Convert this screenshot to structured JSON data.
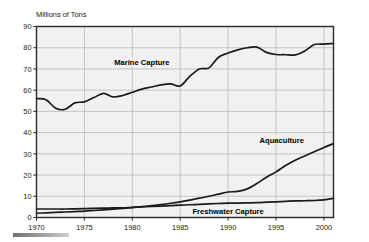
{
  "chart_data": {
    "type": "line",
    "title": "",
    "xlabel": "",
    "ylabel": "Millions of Tons",
    "xlim": [
      1970,
      2001
    ],
    "ylim": [
      0,
      90
    ],
    "grid": true,
    "legend_position": "inline-annotations",
    "xticks": [
      "1970",
      "1975",
      "1980",
      "1985",
      "1990",
      "1995",
      "2000"
    ],
    "xtick_values": [
      1970,
      1975,
      1980,
      1985,
      1990,
      1995,
      2000
    ],
    "yticks": [
      "0",
      "10",
      "20",
      "30",
      "40",
      "50",
      "60",
      "70",
      "80",
      "90"
    ],
    "ytick_values": [
      0,
      10,
      20,
      30,
      40,
      50,
      60,
      70,
      80,
      90
    ],
    "x": [
      1970,
      1971,
      1972,
      1973,
      1974,
      1975,
      1976,
      1977,
      1978,
      1979,
      1980,
      1981,
      1982,
      1983,
      1984,
      1985,
      1986,
      1987,
      1988,
      1989,
      1990,
      1991,
      1992,
      1993,
      1994,
      1995,
      1996,
      1997,
      1998,
      1999,
      2000,
      2001
    ],
    "series": [
      {
        "name": "Marine Capture",
        "label": "Marine Capture",
        "color": "#1a1a1a",
        "values": [
          56.0,
          55.5,
          51.5,
          51.0,
          54.0,
          54.5,
          56.5,
          58.5,
          56.8,
          57.5,
          59.0,
          60.5,
          61.5,
          62.5,
          63.0,
          62.0,
          66.5,
          70.0,
          70.5,
          75.5,
          77.5,
          79.0,
          80.0,
          80.3,
          77.8,
          76.8,
          76.7,
          76.6,
          78.5,
          81.5,
          81.7,
          82.0
        ]
      },
      {
        "name": "Aquaculture",
        "label": "Aquaculture",
        "color": "#1a1a1a",
        "values": [
          2.0,
          2.2,
          2.4,
          2.6,
          2.8,
          3.0,
          3.3,
          3.6,
          3.9,
          4.3,
          4.7,
          5.1,
          5.6,
          6.1,
          6.7,
          7.4,
          8.2,
          9.1,
          10.0,
          11.0,
          12.0,
          12.3,
          13.5,
          16.0,
          19.0,
          21.5,
          24.5,
          27.0,
          29.0,
          31.0,
          33.0,
          34.8
        ]
      },
      {
        "name": "Freshwater Capture",
        "label": "Freshwater Capture",
        "color": "#1a1a1a",
        "values": [
          4.0,
          4.0,
          4.0,
          4.0,
          4.1,
          4.2,
          4.3,
          4.4,
          4.5,
          4.6,
          4.8,
          5.0,
          5.2,
          5.4,
          5.6,
          5.8,
          6.0,
          6.2,
          6.4,
          6.6,
          6.8,
          6.8,
          6.9,
          7.0,
          7.2,
          7.4,
          7.6,
          7.8,
          7.9,
          8.0,
          8.3,
          9.0
        ]
      }
    ],
    "annotations": [
      {
        "text": "Marine Capture",
        "x": 1981.0,
        "y": 72.5
      },
      {
        "text": "Aquaculture",
        "x": 1995.6,
        "y": 36.0
      },
      {
        "text": "Freshwater Capture",
        "x": 1990.0,
        "y": 2.3
      }
    ],
    "colors": {
      "line": "#1a1a1a",
      "plot_background": "#f1f1f1",
      "gridline": "#b9b9b9",
      "axis": "#2b2b2b",
      "page_background": "#ffffff",
      "footer_rule": "#8a8a8a"
    }
  }
}
